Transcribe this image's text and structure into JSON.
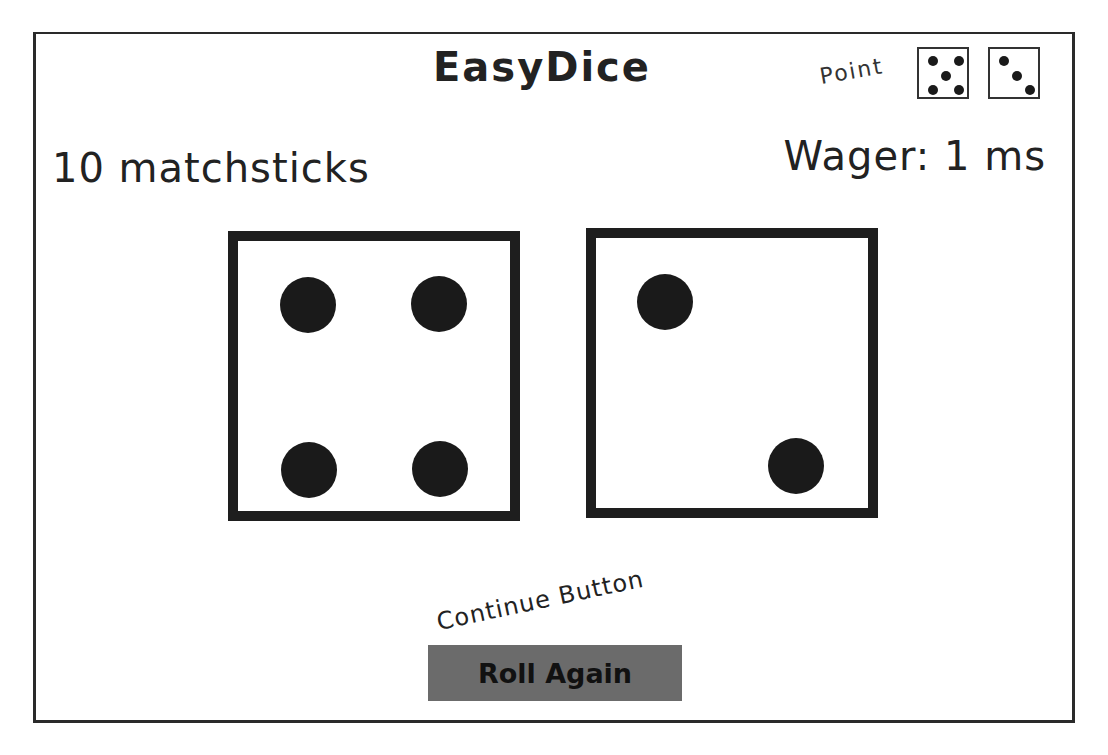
{
  "app": {
    "title": "EasyDice"
  },
  "point": {
    "label": "Point",
    "dice": [
      5,
      3
    ]
  },
  "player": {
    "balance_text": "10 matchsticks",
    "wager_text": "Wager: 1 ms"
  },
  "roll": {
    "dice": [
      4,
      2
    ]
  },
  "continue": {
    "annotation": "Continue Button",
    "button_label": "Roll Again"
  },
  "colors": {
    "button_bg": "#6b6b6b",
    "pip": "#1a1a1a",
    "border": "#1e1e1e"
  }
}
